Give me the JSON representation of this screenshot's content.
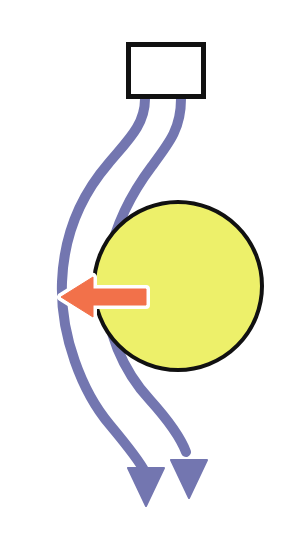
{
  "canvas": {
    "width": 292,
    "height": 537,
    "background": "#ffffff",
    "title": "Flow past a circular body diagram"
  },
  "colors": {
    "streamline_purple": "#7376B0",
    "streamline_purple_dark": "#5F6296",
    "body_yellow": "#EDF06A",
    "body_outline_black": "#111111",
    "force_arrow_orange": "#F2714A",
    "force_arrow_outline": "#FFFFFF",
    "source_box_fill": "#FFFFFF",
    "source_box_stroke": "#111111"
  },
  "shapes": {
    "source_box": {
      "name": "source-box",
      "label": "",
      "x": 126,
      "y": 42,
      "width": 80,
      "height": 57,
      "stroke_width": 5,
      "fill": "#FFFFFF",
      "stroke": "#111111"
    },
    "body_circle": {
      "name": "body-circle",
      "label": "",
      "cx": 178,
      "cy": 286,
      "r": 84,
      "stroke_width": 4,
      "fill": "#EDF06A",
      "stroke": "#111111"
    },
    "force_arrow": {
      "name": "force-arrow-left",
      "direction": "left",
      "tip_x": 61,
      "tip_y": 297,
      "tail_x": 146,
      "tail_y": 297,
      "shaft_half_height": 8,
      "head_half_height": 20,
      "head_length": 32,
      "fill": "#F2714A",
      "outline": "#FFFFFF",
      "outline_width": 4
    },
    "streamlines": [
      {
        "name": "streamline-outer",
        "path": "M 145 99 C 145 125, 128 140, 108 164 C 84 192, 64 230, 62 282 C 60 335, 82 392, 110 425 C 130 449, 140 462, 145 472",
        "stroke_width": 10,
        "stroke": "#7376B0",
        "arrowhead": {
          "name": "streamline-outer-arrowhead",
          "tip_x": 146,
          "tip_y": 506,
          "left_x": 128,
          "left_y": 468,
          "right_x": 164,
          "right_y": 468
        }
      },
      {
        "name": "streamline-inner",
        "path": "M 181 99 C 181 128, 170 142, 152 166 C 128 198, 108 238, 106 284 C 104 330, 124 372, 150 400 C 168 420, 180 436, 186 452",
        "stroke_width": 10,
        "stroke": "#7376B0",
        "arrowhead": {
          "name": "streamline-inner-arrowhead",
          "tip_x": 189,
          "tip_y": 498,
          "left_x": 171,
          "left_y": 460,
          "right_x": 207,
          "right_y": 460
        }
      }
    ]
  },
  "legend": {
    "source_box_caption": "",
    "body_caption": "",
    "force_caption": ""
  }
}
